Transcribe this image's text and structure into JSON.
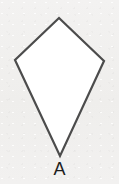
{
  "figure": {
    "shape_name": "kite",
    "label": "A",
    "fill_color": "#ffffff",
    "stroke_color": "#4c4c4c",
    "stroke_width": 2.2,
    "label_color": "#1d1d1d",
    "background_color": "#f1f0ef",
    "vertices": {
      "top": [
        59,
        18
      ],
      "left": [
        15,
        60
      ],
      "right": [
        104,
        61
      ],
      "bottom": [
        60,
        156
      ]
    },
    "points_attr": "59,18 15,60 60,156 104,61"
  }
}
